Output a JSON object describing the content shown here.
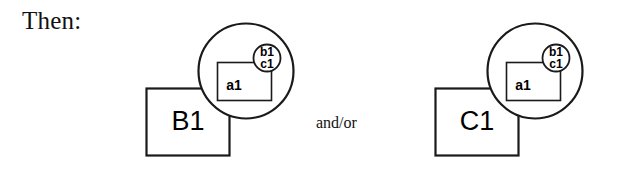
{
  "page": {
    "width": 622,
    "height": 175,
    "background_color": "#ffffff",
    "stroke_color": "#1a1a1a",
    "fill_color": "#ffffff"
  },
  "text": {
    "then_label": "Then:",
    "connector_label": "and/or"
  },
  "diagram": {
    "type": "set-containment-diagram",
    "groups": [
      {
        "id": "group-b",
        "square_label": "B1",
        "circle_label": "",
        "inner_rect_label": "a1",
        "inner_circle_labels": {
          "top": "b1",
          "bottom": "c1"
        },
        "geometry": {
          "square": {
            "x": 146,
            "y": 88,
            "w": 83,
            "h": 67
          },
          "circle": {
            "cx": 246,
            "cy": 71,
            "r": 48
          },
          "inner_rect": {
            "x": 217,
            "y": 62,
            "w": 54,
            "h": 38
          },
          "inner_circle": {
            "cx": 267,
            "cy": 58,
            "r": 14
          }
        }
      },
      {
        "id": "group-c",
        "square_label": "C1",
        "circle_label": "",
        "inner_rect_label": "a1",
        "inner_circle_labels": {
          "top": "b1",
          "bottom": "c1"
        },
        "geometry": {
          "square": {
            "x": 435,
            "y": 88,
            "w": 83,
            "h": 67
          },
          "circle": {
            "cx": 535,
            "cy": 71,
            "r": 48
          },
          "inner_rect": {
            "x": 506,
            "y": 62,
            "w": 54,
            "h": 38
          },
          "inner_circle": {
            "cx": 556,
            "cy": 58,
            "r": 14
          }
        }
      }
    ]
  }
}
